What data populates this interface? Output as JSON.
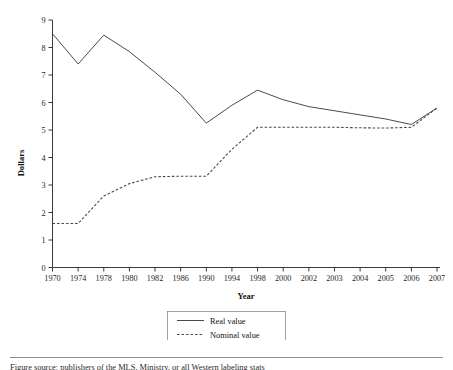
{
  "chart_data": {
    "type": "line",
    "title": "",
    "xlabel": "Year",
    "ylabel": "Dollars",
    "categories": [
      "1970",
      "1974",
      "1978",
      "1980",
      "1982",
      "1986",
      "1990",
      "1994",
      "1998",
      "2000",
      "2002",
      "2003",
      "2004",
      "2005",
      "2006",
      "2007"
    ],
    "series": [
      {
        "name": "Real value",
        "style": "solid",
        "values": [
          8.5,
          7.4,
          8.45,
          7.85,
          7.1,
          6.3,
          5.25,
          5.9,
          6.45,
          6.1,
          5.85,
          5.7,
          5.55,
          5.4,
          5.2,
          5.8
        ]
      },
      {
        "name": "Nominal value",
        "style": "dashed",
        "values": [
          1.6,
          1.6,
          2.6,
          3.05,
          3.3,
          3.32,
          3.32,
          4.3,
          5.1,
          5.1,
          5.1,
          5.1,
          5.08,
          5.07,
          5.1,
          5.8
        ]
      }
    ],
    "ylim": [
      0,
      9
    ],
    "yticks": [
      "0",
      "1",
      "2",
      "3",
      "4",
      "5",
      "6",
      "7",
      "8",
      "9"
    ],
    "grid": false,
    "legend_position": "bottom-center",
    "legend_entries": [
      "Real value",
      "Nominal value"
    ]
  },
  "axes": {
    "y_label": "Dollars",
    "x_label": "Year",
    "y_ticks": [
      "0",
      "1",
      "2",
      "3",
      "4",
      "5",
      "6",
      "7",
      "8",
      "9"
    ],
    "x_ticks": [
      "1970",
      "1974",
      "1978",
      "1980",
      "1982",
      "1986",
      "1990",
      "1994",
      "1998",
      "2000",
      "2002",
      "2003",
      "2004",
      "2005",
      "2006",
      "2007"
    ]
  },
  "legend": {
    "items": [
      {
        "label": "Real value",
        "style": "solid"
      },
      {
        "label": "Nominal value",
        "style": "dashed"
      }
    ]
  },
  "footer": {
    "note": "Figure source: publishers of the MLS, Ministry, or all Western labeling stats"
  },
  "colors": {
    "line": "#4a4a4a",
    "axis": "#3a3a3a",
    "text": "#1a1a1a",
    "background": "#ffffff"
  }
}
